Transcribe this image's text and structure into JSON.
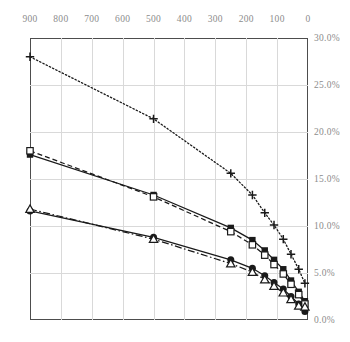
{
  "chart_data": {
    "type": "line",
    "title": "",
    "subtitle": "",
    "xlabel": "",
    "ylabel": "",
    "xlim": [
      900,
      0
    ],
    "ylim": [
      0.0,
      30.0
    ],
    "x_reversed": true,
    "grid": true,
    "legend": "none",
    "x_ticks": [
      900,
      800,
      700,
      600,
      500,
      400,
      300,
      200,
      100,
      0
    ],
    "x_tick_labels": [
      "900",
      "800",
      "700",
      "600",
      "500",
      "400",
      "300",
      "200",
      "100",
      "0"
    ],
    "y_ticks": [
      0.0,
      5.0,
      10.0,
      15.0,
      20.0,
      25.0,
      30.0
    ],
    "y_tick_labels": [
      "0.0%",
      "5.0%",
      "10.0%",
      "15.0%",
      "20.0%",
      "25.0%",
      "30.0%"
    ],
    "y_axis_side": "right",
    "series": [
      {
        "name": "series-plus-dotted",
        "marker": "plus",
        "line_style": "dotted",
        "color": "#1a1a1a",
        "x": [
          900,
          500,
          250,
          180,
          140,
          110,
          80,
          55,
          30,
          10
        ],
        "values": [
          28.0,
          21.4,
          15.6,
          13.3,
          11.4,
          10.1,
          8.6,
          7.0,
          5.4,
          3.9
        ]
      },
      {
        "name": "series-filled-square-solid",
        "marker": "filled-square",
        "line_style": "solid",
        "color": "#1a1a1a",
        "x": [
          900,
          500,
          250,
          180,
          140,
          110,
          80,
          55,
          30,
          10
        ],
        "values": [
          17.6,
          13.3,
          9.8,
          8.5,
          7.4,
          6.4,
          5.4,
          4.2,
          3.0,
          2.0
        ]
      },
      {
        "name": "series-hollow-square-dashed",
        "marker": "hollow-square",
        "line_style": "dashed",
        "color": "#1a1a1a",
        "x": [
          900,
          500,
          250,
          180,
          140,
          110,
          80,
          55,
          30,
          10
        ],
        "values": [
          18.0,
          13.1,
          9.4,
          8.0,
          6.9,
          5.9,
          4.9,
          3.8,
          2.7,
          1.7
        ]
      },
      {
        "name": "series-filled-circle-solid",
        "marker": "filled-circle",
        "line_style": "solid",
        "color": "#1a1a1a",
        "x": [
          900,
          500,
          250,
          180,
          140,
          110,
          80,
          55,
          30,
          10
        ],
        "values": [
          11.6,
          8.8,
          6.4,
          5.5,
          4.7,
          4.0,
          3.3,
          2.5,
          1.7,
          0.9
        ]
      },
      {
        "name": "series-hollow-triangle-dashdot",
        "marker": "hollow-triangle",
        "line_style": "dashdot",
        "color": "#1a1a1a",
        "x": [
          900,
          500,
          250,
          180,
          140,
          110,
          80,
          55,
          30,
          10
        ],
        "values": [
          11.8,
          8.6,
          6.0,
          5.1,
          4.3,
          3.6,
          2.9,
          2.2,
          1.5,
          1.4
        ]
      }
    ],
    "colors": {
      "axis": "#4d4d4d",
      "grid": "#d9d9d9",
      "tick_label": "#8c8c8c",
      "ink": "#1a1a1a",
      "background": "#ffffff"
    }
  }
}
